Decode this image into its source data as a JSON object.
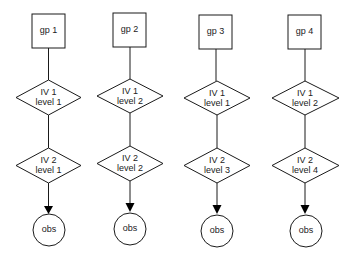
{
  "diagram": {
    "type": "flowchart",
    "colors": {
      "stroke": "#1a1a1a",
      "fill": "#ffffff",
      "text": "#222222",
      "arrow": "#000000"
    },
    "columns": [
      {
        "group": "gp 1",
        "iv1": {
          "line1": "IV 1",
          "line2": "level 1"
        },
        "iv2": {
          "line1": "IV 2",
          "line2": "level 1"
        },
        "obs": "obs"
      },
      {
        "group": "gp 2",
        "iv1": {
          "line1": "IV 1",
          "line2": "level 2"
        },
        "iv2": {
          "line1": "IV 2",
          "line2": "level 2"
        },
        "obs": "obs"
      },
      {
        "group": "gp 3",
        "iv1": {
          "line1": "IV 1",
          "line2": "level 1"
        },
        "iv2": {
          "line1": "IV 2",
          "line2": "level 3"
        },
        "obs": "obs"
      },
      {
        "group": "gp 4",
        "iv1": {
          "line1": "IV 1",
          "line2": "level 2"
        },
        "iv2": {
          "line1": "IV 2",
          "line2": "level 4"
        },
        "obs": "obs"
      }
    ]
  }
}
